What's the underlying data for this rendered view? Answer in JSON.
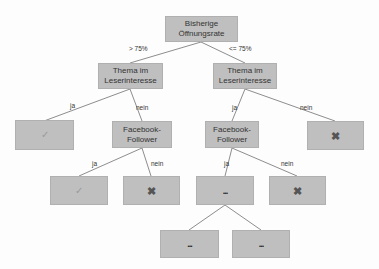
{
  "diagram": {
    "type": "decision-tree",
    "colors": {
      "node_fill": "#bfbfbf",
      "edge": "#666666",
      "background": "#fdfdfd"
    },
    "nodes": {
      "root": {
        "label": "Bisherige\nÖffnungsrate"
      },
      "l1_left": {
        "label": "Thema im\nLeserinteresse"
      },
      "l1_right": {
        "label": "Thema im\nLeserinteresse"
      },
      "l2_left_yes": {
        "icon": "check-icon",
        "glyph": "✓"
      },
      "l2_left_no": {
        "label": "Facebook-\nFollower"
      },
      "l2_right_yes": {
        "label": "Facebook-\nFollower"
      },
      "l2_right_no": {
        "icon": "x-icon",
        "glyph": "✖"
      },
      "l3_a": {
        "icon": "check-icon",
        "glyph": "✓"
      },
      "l3_b": {
        "icon": "x-icon",
        "glyph": "✖"
      },
      "l3_c": {
        "label": "..."
      },
      "l3_d": {
        "icon": "x-icon",
        "glyph": "✖"
      },
      "l4_a": {
        "label": "..."
      },
      "l4_b": {
        "label": "..."
      }
    },
    "edge_labels": {
      "root_left": "> 75%",
      "root_right": "<= 75%",
      "l1_left_yes": "ja",
      "l1_left_no": "nein",
      "l1_right_yes": "ja",
      "l1_right_no": "nein",
      "l2_left_yes": "ja",
      "l2_left_no": "nein",
      "l2_right_yes": "ja",
      "l2_right_no": "nein"
    }
  }
}
